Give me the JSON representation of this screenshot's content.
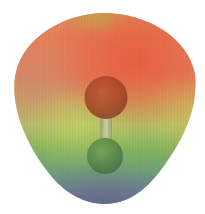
{
  "figure": {
    "name": "electrostatic-potential-map",
    "background_color": "#ffffff",
    "surface": {
      "band": {
        "top_salmon": "#db9160",
        "orange_salmon": "#e77f58",
        "salmon_red": "#e4825f",
        "khaki_transition": "#ccaa62",
        "yellow_green": "#b3c468",
        "green": "#82b35e",
        "teal_gray": "#71a178",
        "slate_blue": "#6f8292",
        "bottom_purple": "#626786"
      },
      "accents": {
        "red_hotspot": "rgba(233,78,48,0.80)",
        "left_dusty_tan": "rgba(198,140,115,0.70)",
        "top_olive_patch": "rgba(186,176,70,0.75)",
        "mid_yellow_green_glow": "rgba(208,220,95,0.55)",
        "right_yellow_edge": "rgba(214,186,88,0.50)",
        "bottom_purple_haze": "rgba(95,97,133,0.55)"
      },
      "texture_line_color": "rgba(100,80,70,0.06)"
    },
    "molecule": {
      "bond": {
        "edge_color": "#8f9673",
        "center_color": "#d9d5b2"
      },
      "top_atom": {
        "highlight_color": "#bc4c2e",
        "body_color": "#a1371f",
        "edge_color": "#7b2a16"
      },
      "bottom_atom": {
        "highlight_color": "#71a158",
        "body_color": "#4f7f45",
        "edge_color": "#3c6338"
      }
    }
  }
}
